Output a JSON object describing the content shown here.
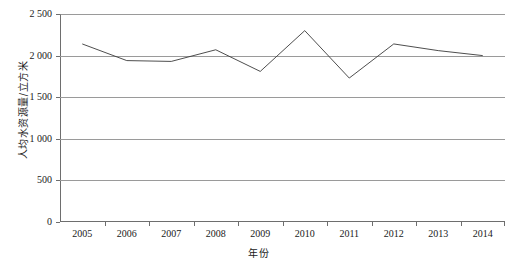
{
  "chart_data": {
    "type": "line",
    "title": "",
    "xlabel": "年份",
    "ylabel": "人均水资源量/立方米",
    "categories": [
      "2005",
      "2006",
      "2007",
      "2008",
      "2009",
      "2010",
      "2011",
      "2012",
      "2013",
      "2014"
    ],
    "x": [
      2005,
      2006,
      2007,
      2008,
      2009,
      2010,
      2011,
      2012,
      2013,
      2014
    ],
    "values": [
      2140,
      1940,
      1930,
      2070,
      1810,
      2300,
      1730,
      2140,
      2060,
      2000
    ],
    "series": [
      {
        "name": "人均水资源量",
        "values": [
          2140,
          1940,
          1930,
          2070,
          1810,
          2300,
          1730,
          2140,
          2060,
          2000
        ]
      }
    ],
    "ylim": [
      0,
      2500
    ],
    "y_ticks": [
      0,
      500,
      1000,
      1500,
      2000,
      2500
    ],
    "y_tick_labels": [
      "0",
      "500",
      "1 000",
      "1 500",
      "2 000",
      "2 500"
    ],
    "grid": true,
    "legend": "none",
    "line_color": "#3a3a3a",
    "grid_color": "#9a9a9a",
    "axis_color": "#6e6e6e",
    "background_color": "#ffffff"
  }
}
